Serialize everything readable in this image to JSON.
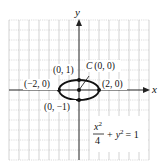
{
  "diagram": {
    "type": "ellipse-graph",
    "axes": {
      "x_label": "x",
      "y_label": "y"
    },
    "grid": {
      "x_range": [
        -7,
        7
      ],
      "y_range": [
        -7,
        7
      ],
      "cell_units": 1
    },
    "ellipse": {
      "center": [
        0,
        0
      ],
      "a": 2,
      "b": 1
    },
    "points": [
      {
        "label": "(0, 1)",
        "x": 0,
        "y": 1
      },
      {
        "label": "(−2, 0)",
        "x": -2,
        "y": 0
      },
      {
        "label": "(2, 0)",
        "x": 2,
        "y": 0
      },
      {
        "label": "(0, −1)",
        "x": 0,
        "y": -1
      },
      {
        "label": "(0, 0)",
        "x": 0,
        "y": 0
      }
    ],
    "center_label": {
      "letter": "C",
      "coords": "(0, 0)"
    },
    "equation": {
      "numerator": "x",
      "num_exp": "2",
      "denominator": "4",
      "rest_var": "y",
      "rest_exp": "2",
      "plus": "+",
      "equals": "= 1"
    },
    "colors": {
      "grid": "#bfbfbf",
      "axis": "#222222",
      "curve": "#111111"
    }
  }
}
